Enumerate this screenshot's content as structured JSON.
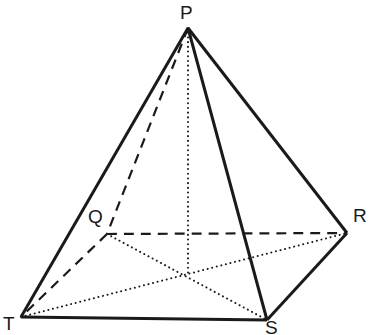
{
  "figure": {
    "kind": "solid-geometry-diagram",
    "background_color": "#ffffff",
    "stroke_color": "#1a1a1a",
    "label_color": "#1a1a1a",
    "canvas": {
      "width": 369,
      "height": 335
    },
    "vertices": [
      {
        "id": "P",
        "label": "P",
        "x": 188,
        "y": 28,
        "label_x": 180,
        "label_y": 3,
        "visible": true
      },
      {
        "id": "Q",
        "label": "Q",
        "x": 107,
        "y": 234,
        "label_x": 88,
        "label_y": 207,
        "visible": false
      },
      {
        "id": "R",
        "label": "R",
        "x": 347,
        "y": 233,
        "label_x": 353,
        "label_y": 206,
        "visible": true
      },
      {
        "id": "S",
        "label": "S",
        "x": 267,
        "y": 320,
        "label_x": 265,
        "label_y": 318,
        "visible": true
      },
      {
        "id": "T",
        "label": "T",
        "x": 21,
        "y": 317,
        "label_x": 3,
        "label_y": 314,
        "visible": true
      }
    ],
    "center": {
      "id": "O",
      "x": 188,
      "y": 275
    },
    "edges": [
      {
        "name": "edge-P-T",
        "from": "P",
        "to": "T",
        "style": "solid",
        "width": 3.0
      },
      {
        "name": "edge-P-S",
        "from": "P",
        "to": "S",
        "style": "solid",
        "width": 3.0
      },
      {
        "name": "edge-P-R",
        "from": "P",
        "to": "R",
        "style": "solid",
        "width": 3.0
      },
      {
        "name": "edge-T-S",
        "from": "T",
        "to": "S",
        "style": "solid",
        "width": 3.0
      },
      {
        "name": "edge-S-R",
        "from": "S",
        "to": "R",
        "style": "solid",
        "width": 3.0
      },
      {
        "name": "edge-P-Q",
        "from": "P",
        "to": "Q",
        "style": "dashed",
        "width": 2.2
      },
      {
        "name": "edge-Q-R",
        "from": "Q",
        "to": "R",
        "style": "dashed",
        "width": 2.2
      },
      {
        "name": "edge-Q-T",
        "from": "Q",
        "to": "T",
        "style": "dashed",
        "width": 2.2
      }
    ],
    "construction_lines": [
      {
        "name": "diagonal-T-R",
        "from": "T",
        "to": "R",
        "style": "dotted",
        "width": 2.0
      },
      {
        "name": "diagonal-Q-S",
        "from": "Q",
        "to": "S",
        "style": "dotted",
        "width": 2.0
      },
      {
        "name": "altitude-P-O",
        "from": "P",
        "to": "O",
        "style": "dotted",
        "width": 2.0
      }
    ]
  }
}
